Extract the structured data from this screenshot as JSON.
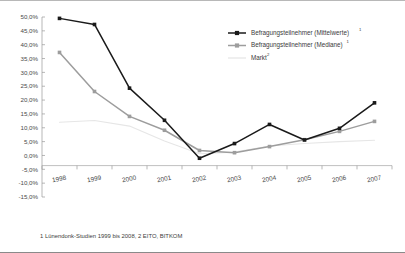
{
  "figure": {
    "footnote": "1  Lünendonk-Studien 1999 bis 2008,  2  EITO, BITKOM"
  },
  "legend": {
    "position": "top-right",
    "entries": [
      {
        "label": "Befragungsteilnehmer (Mittelwerte)",
        "sup": "1",
        "color": "#1a1a1a",
        "marker": "square",
        "name": "legend-item-mittelwerte"
      },
      {
        "label": "Befragungsteilnehmer (Mediane)",
        "sup": "1",
        "color": "#9d9d9d",
        "marker": "square",
        "name": "legend-item-mediane"
      },
      {
        "label": "Markt",
        "sup": "2",
        "color": "#e2e2e2",
        "marker": "none",
        "name": "legend-item-markt"
      }
    ]
  },
  "chart_data": {
    "type": "line",
    "title": "",
    "xlabel": "",
    "ylabel": "",
    "grid": false,
    "ylim": [
      -15,
      50
    ],
    "ytick_labels": [
      "50,0%",
      "45,0%",
      "40,0%",
      "35,0%",
      "30,0%",
      "25,0%",
      "20,0%",
      "15,0%",
      "10,0%",
      "5,0%",
      "0,0%",
      "-5,0%",
      "-10,0%",
      "-15,0%"
    ],
    "ytick_values": [
      50,
      45,
      40,
      35,
      30,
      25,
      20,
      15,
      10,
      5,
      0,
      -5,
      -10,
      -15
    ],
    "categories": [
      "1998",
      "1999",
      "2000",
      "2001",
      "2002",
      "2003",
      "2004",
      "2005",
      "2006",
      "2007"
    ],
    "series": [
      {
        "name": "Befragungsteilnehmer (Mittelwerte)",
        "color": "#1a1a1a",
        "marker": "square",
        "values": [
          49.5,
          47.3,
          24.3,
          12.7,
          -1.0,
          4.3,
          11.2,
          5.6,
          9.8,
          19.0
        ]
      },
      {
        "name": "Befragungsteilnehmer (Mediane)",
        "color": "#9d9d9d",
        "marker": "square",
        "values": [
          37.2,
          23.1,
          14.1,
          9.1,
          1.8,
          1.0,
          3.2,
          5.7,
          8.7,
          12.3
        ]
      },
      {
        "name": "Markt",
        "color": "#e6e6e6",
        "marker": "none",
        "values": [
          12.0,
          12.6,
          10.6,
          5.2,
          0.6,
          1.2,
          3.4,
          4.3,
          5.0,
          5.5
        ]
      }
    ]
  }
}
